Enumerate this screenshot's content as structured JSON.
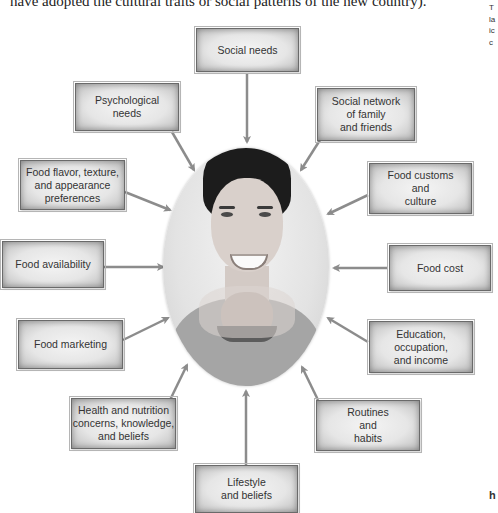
{
  "intro_text": "have adopted the cultural traits or social patterns of the new country).",
  "margin_text": [
    "T",
    "la",
    "ic",
    "c"
  ],
  "margin_bottom_text": "h",
  "center": {
    "subject": "woman-eating-burger-photo"
  },
  "factors": [
    {
      "id": "social-needs",
      "label": "Social needs"
    },
    {
      "id": "psychological-needs",
      "label": "Psychological\nneeds"
    },
    {
      "id": "social-network",
      "label": "Social network\nof family\nand friends"
    },
    {
      "id": "food-flavor",
      "label": "Food flavor, texture,\nand appearance\npreferences"
    },
    {
      "id": "food-customs",
      "label": "Food customs\nand\nculture"
    },
    {
      "id": "food-availability",
      "label": "Food availability"
    },
    {
      "id": "food-cost",
      "label": "Food cost"
    },
    {
      "id": "food-marketing",
      "label": "Food marketing"
    },
    {
      "id": "education",
      "label": "Education,\noccupation,\nand income"
    },
    {
      "id": "health-nutrition",
      "label": "Health and nutrition\nconcerns, knowledge,\nand beliefs"
    },
    {
      "id": "routines",
      "label": "Routines\nand\nhabits"
    },
    {
      "id": "lifestyle",
      "label": "Lifestyle\nand beliefs"
    }
  ],
  "colors": {
    "arrow": "#8c8c8c",
    "box_border": "#6a6a6a",
    "text": "#333333"
  }
}
